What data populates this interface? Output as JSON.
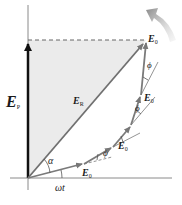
{
  "diagram": {
    "type": "phasor-diagram",
    "labels": {
      "vertical_projection": {
        "main": "E",
        "sub": "P"
      },
      "resultant": {
        "main": "E",
        "sub": "R"
      },
      "phasor": {
        "main": "E",
        "sub": "0"
      },
      "alpha": "α",
      "omega_t": "ωt",
      "phi": "ϕ"
    },
    "phasor_count": 5,
    "colors": {
      "axes": "#8a8a8a",
      "vertical_arrow": "#111111",
      "resultant_arrow": "#707070",
      "phasor_arrow": "#7a7a7a",
      "shaded_region": "#e9e9e9",
      "dashed_line": "#666666",
      "rotation_arrow": "#8a8a8a"
    }
  }
}
